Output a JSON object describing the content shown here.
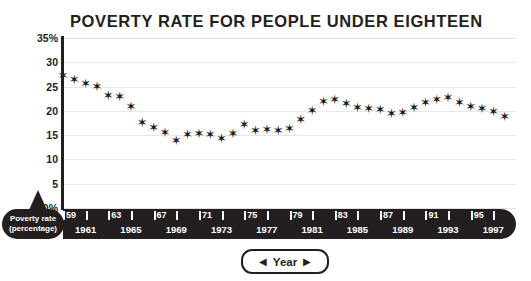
{
  "chart_data": {
    "type": "scatter",
    "title": "POVERTY RATE FOR PEOPLE UNDER EIGHTEEN",
    "xlabel": "Year",
    "ylabel": "Poverty rate (percentage)",
    "xlim": [
      1959,
      1999
    ],
    "ylim": [
      0,
      35
    ],
    "grid": true,
    "legend": false,
    "marker": "six-pointed-star",
    "series_color": "#1a1a1a",
    "ytick_labels": [
      "35%",
      "30",
      "25",
      "20",
      "15",
      "10",
      "5",
      "0%"
    ],
    "ytick_values": [
      35,
      30,
      25,
      20,
      15,
      10,
      5,
      0
    ],
    "xtick_labels_top": [
      "59",
      "63",
      "67",
      "71",
      "75",
      "79",
      "83",
      "87",
      "91",
      "95"
    ],
    "xtick_values_top": [
      1959,
      1963,
      1967,
      1971,
      1975,
      1979,
      1983,
      1987,
      1991,
      1995
    ],
    "xtick_labels_bottom": [
      "1961",
      "1965",
      "1969",
      "1973",
      "1977",
      "1981",
      "1985",
      "1989",
      "1993",
      "1997"
    ],
    "xtick_values_bottom": [
      1961,
      1965,
      1969,
      1973,
      1977,
      1981,
      1985,
      1989,
      1993,
      1997
    ],
    "xtick_minor_values": [
      1959,
      1961,
      1963,
      1965,
      1967,
      1969,
      1971,
      1973,
      1975,
      1977,
      1979,
      1981,
      1983,
      1985,
      1987,
      1989,
      1991,
      1993,
      1995,
      1997
    ],
    "x": [
      1959,
      1960,
      1961,
      1962,
      1963,
      1964,
      1965,
      1966,
      1967,
      1968,
      1969,
      1970,
      1971,
      1972,
      1973,
      1974,
      1975,
      1976,
      1977,
      1978,
      1979,
      1980,
      1981,
      1982,
      1983,
      1984,
      1985,
      1986,
      1987,
      1988,
      1989,
      1990,
      1991,
      1992,
      1993,
      1994,
      1995,
      1996,
      1997,
      1998
    ],
    "values": [
      27.3,
      26.5,
      25.6,
      25.0,
      23.1,
      23.0,
      21.0,
      17.6,
      16.6,
      15.6,
      14.0,
      15.1,
      15.3,
      15.1,
      14.4,
      15.4,
      17.1,
      16.0,
      16.2,
      15.9,
      16.4,
      18.3,
      20.0,
      21.9,
      22.3,
      21.5,
      20.7,
      20.5,
      20.3,
      19.5,
      19.6,
      20.6,
      21.8,
      22.3,
      22.7,
      21.8,
      20.8,
      20.5,
      19.9,
      18.9
    ]
  },
  "axis_labels": {
    "y_badge_line1": "Poverty rate",
    "y_badge_line2": "(percentage)",
    "x_badge_label": "Year",
    "x_badge_left_arrow": "◀",
    "x_badge_right_arrow": "▶"
  },
  "icons": {
    "star_marker": "✶"
  }
}
